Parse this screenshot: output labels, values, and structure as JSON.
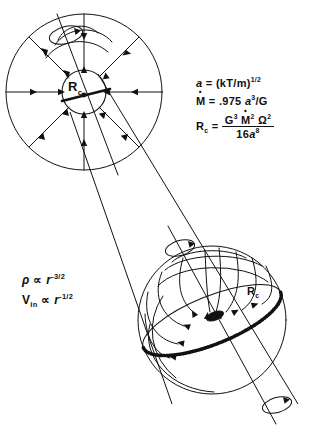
{
  "figure": {
    "background": "#ffffff",
    "ink": "#111111",
    "width": 321,
    "height": 433
  },
  "equations": {
    "sound_speed": {
      "lhs": "a",
      "eq": "=",
      "rhs_base": "(kT/m)",
      "rhs_exp": "1/2"
    },
    "mass_rate": {
      "lhs": "M",
      "lhs_dot": true,
      "eq": "=",
      "coefficient": ".975",
      "var": "a",
      "var_exp": "3",
      "over": "/G"
    },
    "centrifugal_radius": {
      "lhs": "R",
      "lhs_sub": "c",
      "eq": "=",
      "numerator": {
        "g": "G",
        "g_exp": "3",
        "m": "M",
        "m_dot": true,
        "m_exp": "2",
        "omega": "Ω",
        "omega_exp": "2"
      },
      "denominator": {
        "coefficient": "16",
        "var": "a",
        "var_exp": "8"
      }
    },
    "density_law": {
      "lhs": "ρ",
      "prop": "∝",
      "var": "r",
      "exp": "-3/2"
    },
    "infall_velocity_law": {
      "lhs": "V",
      "lhs_sub": "in",
      "prop": "∝",
      "var": "r",
      "exp": "-1/2"
    }
  },
  "labels": {
    "upper_sphere_rc": "R",
    "upper_sphere_rc_sub": "c",
    "lower_sphere_rc": "R",
    "lower_sphere_rc_sub": "c"
  },
  "diagram": {
    "upper_view": {
      "name": "large-scale-collapsing-cloud",
      "outer_radius": 78,
      "inner_radius": 22,
      "center_x": 84,
      "center_y": 92,
      "inflow_arrow_count": 8,
      "rotation_axis": true
    },
    "lower_view": {
      "name": "centrifugal-disk-sphere",
      "radius": 74,
      "center_x": 212,
      "center_y": 320,
      "has_equatorial_disk": true,
      "streamline_count": 9,
      "rotation_axis": true
    },
    "projection_lines": 2
  }
}
